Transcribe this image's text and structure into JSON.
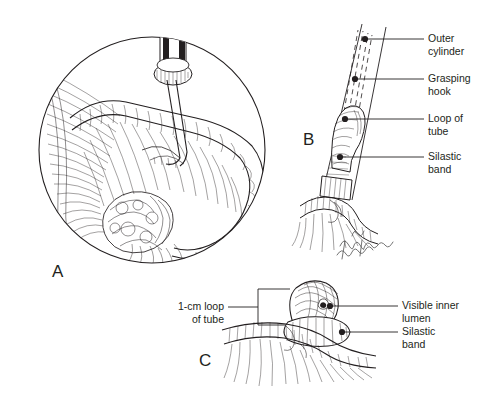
{
  "figure": {
    "type": "medical-line-illustration",
    "background_color": "#ffffff",
    "ink_color": "#231f20"
  },
  "panels": [
    {
      "letter": "A",
      "name": "panel-a-laparoscopic-view",
      "description": "Circular magnified laparoscopic view: band applicator with grasping hook drawing the fallopian tube into the outer cylinder; mesosalpinx, ovary and fimbriae visible.",
      "shape": "circle"
    },
    {
      "letter": "B",
      "name": "panel-b-tube-drawn-into-cylinder",
      "description": "Tube pulled up inside the outer cylinder by the grasping hook; Silastic band at the base of the cylinder.",
      "shape": "open"
    },
    {
      "letter": "C",
      "name": "panel-c-banded-loop",
      "description": "Completed band application: 1-cm knuckle of tube with visible inner lumen above the Silastic band.",
      "shape": "open"
    }
  ],
  "callouts": {
    "panel_b": [
      {
        "name": "outer-cylinder",
        "label": "Outer\ncylinder",
        "side": "right"
      },
      {
        "name": "grasping-hook",
        "label": "Grasping\nhook",
        "side": "right"
      },
      {
        "name": "loop-of-tube",
        "label": "Loop of\ntube",
        "side": "right"
      },
      {
        "name": "silastic-band-b",
        "label": "Silastic\nband",
        "side": "right"
      }
    ],
    "panel_c": [
      {
        "name": "one-cm-loop-of-tube",
        "label": "1-cm loop\nof tube",
        "side": "left"
      },
      {
        "name": "visible-inner-lumen",
        "label": "Visible inner\nlumen",
        "side": "right"
      },
      {
        "name": "silastic-band-c",
        "label": "Silastic\nband",
        "side": "right"
      }
    ]
  },
  "artist_signature": {
    "name": "artist-signature",
    "text": "handwritten signature"
  }
}
